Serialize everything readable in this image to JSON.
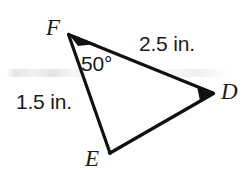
{
  "figure": {
    "kind": "geometry-triangle-diagram",
    "background_color": "#ffffff",
    "stroke_color": "#111111",
    "stroke_width": 3,
    "text_color": "#1a1a1a",
    "canvas": {
      "width": 248,
      "height": 179
    }
  },
  "triangle": {
    "name": "triangle-DEF",
    "vertices": [
      {
        "id": "F",
        "label": "F",
        "x": 68,
        "y": 34
      },
      {
        "id": "D",
        "label": "D",
        "x": 213,
        "y": 93
      },
      {
        "id": "E",
        "label": "E",
        "x": 110,
        "y": 153
      }
    ],
    "sides": [
      {
        "id": "FD",
        "from": "F",
        "to": "D",
        "measure_label": "2.5 in."
      },
      {
        "id": "FE",
        "from": "F",
        "to": "E",
        "measure_label": "1.5 in."
      },
      {
        "id": "ED",
        "from": "E",
        "to": "D",
        "measure_label": ""
      }
    ],
    "angles": [
      {
        "id": "angle-F",
        "at_vertex": "F",
        "label": "50°",
        "value": 50,
        "unit": "degrees"
      }
    ]
  },
  "labels": {
    "vertex_f": "F",
    "vertex_d": "D",
    "vertex_e": "E",
    "side_fd": "2.5 in.",
    "side_fe": "1.5 in.",
    "angle_f": "50°"
  }
}
